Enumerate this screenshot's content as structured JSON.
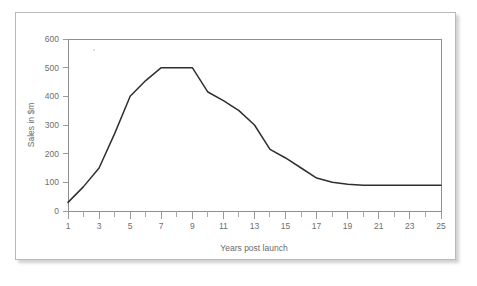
{
  "chart_data": {
    "type": "line",
    "title": "",
    "xlabel": "Years post launch",
    "ylabel": "Sales in $m",
    "xlim": [
      1,
      25
    ],
    "ylim": [
      0,
      600
    ],
    "grid": false,
    "legend": null,
    "x_ticks": [
      1,
      3,
      5,
      7,
      9,
      11,
      13,
      15,
      17,
      19,
      21,
      23,
      25
    ],
    "x_tick_labels": [
      "1",
      "3",
      "5",
      "7",
      "9",
      "11",
      "13",
      "15",
      "17",
      "19",
      "21",
      "23",
      "25"
    ],
    "x_minor_ticks": [
      2,
      4,
      6,
      8,
      10,
      12,
      14,
      16,
      18,
      20,
      22,
      24
    ],
    "y_ticks": [
      0,
      100,
      200,
      300,
      400,
      500,
      600
    ],
    "y_tick_labels": [
      "0",
      "100",
      "200",
      "300",
      "400",
      "500",
      "600"
    ],
    "series": [
      {
        "name": "Sales",
        "color": "#2f2f2f",
        "x": [
          1,
          2,
          3,
          4,
          5,
          6,
          7,
          8,
          9,
          10,
          11,
          12,
          13,
          14,
          15,
          16,
          17,
          18,
          19,
          20,
          21,
          22,
          23,
          24,
          25
        ],
        "values": [
          30,
          85,
          150,
          270,
          400,
          455,
          500,
          500,
          500,
          415,
          385,
          350,
          300,
          215,
          185,
          150,
          115,
          100,
          93,
          90,
          90,
          90,
          90,
          90,
          90
        ]
      }
    ]
  },
  "axes": {
    "y_axis_title": "Sales in $m",
    "x_axis_title": "Years post launch"
  },
  "colors": {
    "line": "#2f2f2f",
    "axis": "#8e8e8e",
    "text": "#6e6e6e",
    "frame_border": "#b9b9b9",
    "page_background": "#ffffff"
  }
}
